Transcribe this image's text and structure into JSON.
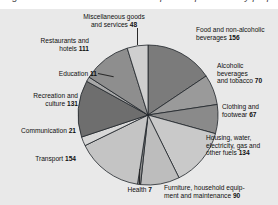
{
  "page": {
    "top_clipped_text": "Figure 3.2: Household final consumption expenditure by purpose",
    "background": "#e9e9e9"
  },
  "chart_data": {
    "type": "pie",
    "title": "",
    "subtitle": "",
    "legend": "labels-with-leader-lines",
    "units": "index (parts per 1000)",
    "total": 1000,
    "categories": [
      "Food and non-alcoholic beverages",
      "Alcoholic beverages and tobacco",
      "Clothing and footwear",
      "Housing, water, electricity, gas and other fuels",
      "Furniture, household equipment and maintenance",
      "Health",
      "Transport",
      "Communication",
      "Recreation and culture",
      "Education",
      "Restaurants and hotels",
      "Miscellaneous goods and services"
    ],
    "values": [
      156,
      70,
      67,
      134,
      90,
      7,
      154,
      21,
      131,
      11,
      111,
      48
    ],
    "colors": [
      "#7b7b7b",
      "#9a9a9a",
      "#8a8a8a",
      "#c9c9c9",
      "#bdbdbd",
      "#8f8f8f",
      "#c4c4c4",
      "#d8d8d8",
      "#6e6e6e",
      "#a8a8a8",
      "#8e8e8e",
      "#cfcfcf"
    ],
    "start_angle_deg": 0,
    "direction": "clockwise",
    "xlabel": "",
    "ylabel": "",
    "grid": false
  },
  "labels": {
    "misc": "Miscellaneous goods\nand services ",
    "misc_value": "48",
    "food": "Food and non-alcoholic\nbeverages ",
    "food_value": "156",
    "alcohol": "Alcoholic\nbeverages\nand tobacco ",
    "alcohol_value": "70",
    "clothing": "Clothing and\nfootwear ",
    "clothing_value": "67",
    "housing": "Housing, water,\nelectricity, gas and\nother fuels ",
    "housing_value": "134",
    "furniture": "Furniture, household equip-\nment and maintenance ",
    "furniture_value": "90",
    "health": "Health ",
    "health_value": "7",
    "transport": "Transport ",
    "transport_value": "154",
    "communication": "Communication ",
    "communication_value": "21",
    "recreation": "Recreation and\nculture ",
    "recreation_value": "131",
    "education": "Education ",
    "education_value": "11",
    "restaurants": "Restaurants and\nhotels ",
    "restaurants_value": "111"
  }
}
